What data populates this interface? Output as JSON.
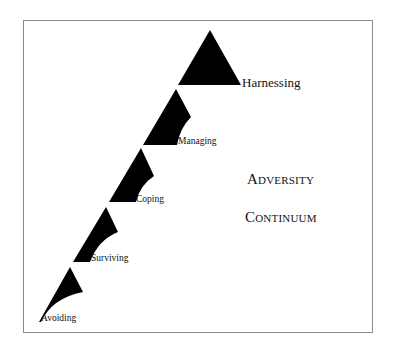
{
  "diagram": {
    "title_lines": [
      "Adversity",
      "Continuum"
    ],
    "stages": [
      {
        "label": "Avoiding",
        "order": 1
      },
      {
        "label": "Surviving",
        "order": 2
      },
      {
        "label": "Coping",
        "order": 3
      },
      {
        "label": "Managing",
        "order": 4
      },
      {
        "label": "Harnessing",
        "order": 5
      }
    ],
    "colors": {
      "shape_fill": "#000000",
      "frame_border": "#8a8a8a",
      "background": "#ffffff",
      "text": "#111111"
    }
  }
}
